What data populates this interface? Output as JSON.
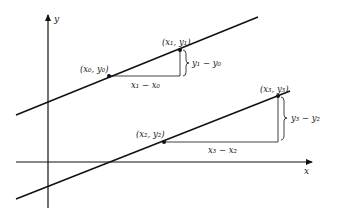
{
  "diagram": {
    "axes": {
      "x_label": "x",
      "y_label": "y"
    },
    "colors": {
      "line": "#111111",
      "background": "#ffffff"
    },
    "lines": [
      {
        "name": "upper-line",
        "points": [
          {
            "label": "(x₀, y₀)"
          },
          {
            "label": "(x₁, y₁)"
          }
        ],
        "run_label": "x₁ − x₀",
        "rise_label": "y₁ − y₀"
      },
      {
        "name": "lower-line",
        "points": [
          {
            "label": "(x₂, y₂)"
          },
          {
            "label": "(x₃, y₃)"
          }
        ],
        "run_label": "x₃ − x₂",
        "rise_label": "y₃ − y₂"
      }
    ]
  }
}
